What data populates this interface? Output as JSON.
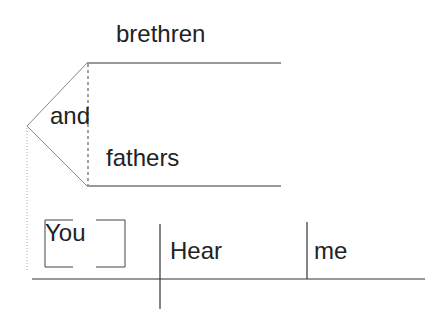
{
  "diagram": {
    "type": "sentence-diagram",
    "sentence": "Brethren and fathers, hear me.",
    "compound_subject": {
      "conjunction": "and",
      "members": [
        "brethren",
        "fathers"
      ]
    },
    "main_line": {
      "subject": "You",
      "subject_note": "understood subject (bracketed)",
      "verb": "Hear",
      "object": "me"
    }
  },
  "words": {
    "brethren": "brethren",
    "and": "and",
    "fathers": "fathers",
    "you": "You",
    "hear": "Hear",
    "me": "me"
  },
  "colors": {
    "line": "#333333",
    "dotted": "#aaaaaa",
    "text": "#222222"
  }
}
